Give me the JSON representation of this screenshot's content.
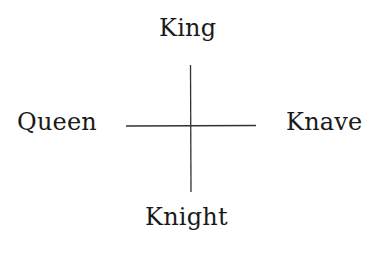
{
  "diagram": {
    "labels": {
      "north": "King",
      "west": "Queen",
      "east": "Knave",
      "south": "Knight"
    },
    "cross": {
      "center_x": 190,
      "center_y": 126,
      "vertical": {
        "x": 190,
        "y1": 65,
        "y2": 192
      },
      "horizontal": {
        "y": 126,
        "x1": 126,
        "x2": 256
      },
      "stroke_color": "#333333"
    }
  }
}
